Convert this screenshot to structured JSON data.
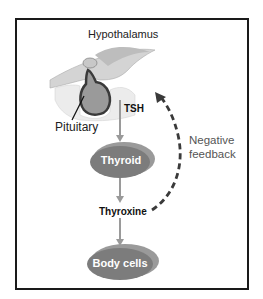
{
  "diagram": {
    "title_structure": "Hypothalamus",
    "gland_label": "Pituitary",
    "hormone_1": "TSH",
    "target_organ": "Thyroid",
    "hormone_2": "Thyroxine",
    "final_target": "Body cells",
    "feedback_line1": "Negative",
    "feedback_line2": "feedback"
  },
  "colors": {
    "node_fill": "#8a8a8a",
    "node_shadow": "#6e6e6e",
    "arrow": "#9a9a9a",
    "dashed_arrow": "#3a3a3a",
    "frame_border": "#1a1a1a"
  }
}
